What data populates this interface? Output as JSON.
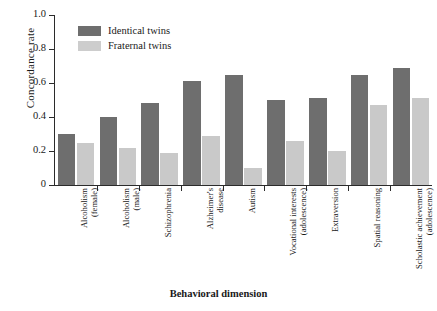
{
  "chart_data": {
    "type": "bar",
    "title": "",
    "xlabel": "Behavioral dimension",
    "ylabel": "Concordance rate",
    "ylim": [
      0,
      1.0
    ],
    "ytick_labels": [
      "0",
      "0.2",
      "0.4",
      "0.6",
      "0.8",
      "1.0"
    ],
    "ytick_values": [
      0,
      0.2,
      0.4,
      0.6,
      0.8,
      1.0
    ],
    "grid": false,
    "legend_position": "upper-left-inside",
    "categories": [
      "Alcoholism\n(female)",
      "Alcoholism\n(male)",
      "Schizophrenia",
      "Alzheimer's\ndisease",
      "Autism",
      "Vocational interests\n(adolescence)",
      "Extraversion",
      "Spatial reasoning",
      "Scholastic achievement\n(adolescence)"
    ],
    "series": [
      {
        "name": "Identical twins",
        "color": "#6e6e6e",
        "values": [
          0.3,
          0.4,
          0.48,
          0.61,
          0.65,
          0.5,
          0.51,
          0.65,
          0.69
        ]
      },
      {
        "name": "Fraternal twins",
        "color": "#c9c9c9",
        "values": [
          0.25,
          0.22,
          0.19,
          0.29,
          0.1,
          0.26,
          0.2,
          0.47,
          0.51
        ]
      }
    ]
  },
  "legend": {
    "items": [
      {
        "label": "Identical twins"
      },
      {
        "label": "Fraternal twins"
      }
    ]
  }
}
